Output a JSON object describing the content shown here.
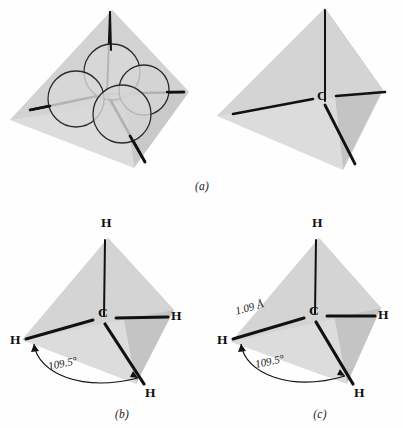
{
  "figure": {
    "background_color": "#fefefe",
    "ink_color": "#111111",
    "face_colors": {
      "left_face": "#d9d9d9",
      "right_face": "#c4c4c4",
      "bottom_face": "#e3e3e3",
      "sphere_fill": "#d5d5d5",
      "sphere_outline": "#2a2a2a"
    }
  },
  "panels": [
    {
      "id": "a-left",
      "caption": "",
      "description": "space-filling spheres inside tetrahedron",
      "atoms": [],
      "annotations": []
    },
    {
      "id": "a-right",
      "caption": "(a)",
      "description": "tetrahedron with central carbon and four bonds",
      "atoms": [
        {
          "label": "C",
          "name": "carbon-center"
        }
      ],
      "annotations": []
    },
    {
      "id": "b",
      "caption": "(b)",
      "description": "methane with hydrogens and bond angle",
      "atoms": [
        {
          "label": "C",
          "name": "carbon-center"
        },
        {
          "label": "H",
          "name": "hydrogen-top"
        },
        {
          "label": "H",
          "name": "hydrogen-left"
        },
        {
          "label": "H",
          "name": "hydrogen-right"
        },
        {
          "label": "H",
          "name": "hydrogen-bottom"
        }
      ],
      "annotations": [
        {
          "text": "109.5°",
          "name": "bond-angle-label"
        }
      ]
    },
    {
      "id": "c",
      "caption": "(c)",
      "description": "methane with bond length and bond angle",
      "atoms": [
        {
          "label": "C",
          "name": "carbon-center"
        },
        {
          "label": "H",
          "name": "hydrogen-top"
        },
        {
          "label": "H",
          "name": "hydrogen-left"
        },
        {
          "label": "H",
          "name": "hydrogen-right"
        },
        {
          "label": "H",
          "name": "hydrogen-bottom"
        }
      ],
      "annotations": [
        {
          "text": "1.09 Å",
          "name": "bond-length-label"
        },
        {
          "text": "109.5°",
          "name": "bond-angle-label"
        }
      ]
    }
  ],
  "labels": {
    "carbon": "C",
    "hydrogen": "H",
    "bond_angle": "109.5°",
    "bond_length": "1.09 Å",
    "caption_a": "(a)",
    "caption_b": "(b)",
    "caption_c": "(c)"
  }
}
